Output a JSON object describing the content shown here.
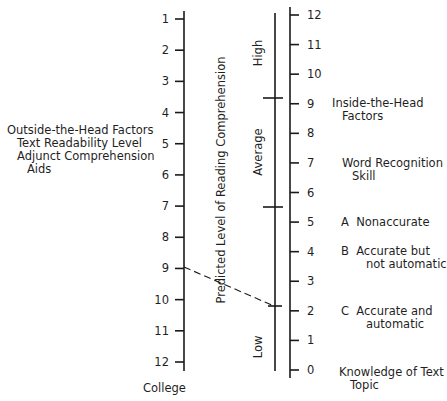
{
  "top_cropped_text": "",
  "left_scale": {
    "title_lines": [
      "Outside-the-Head Factors",
      "Text Readability Level",
      "Adjunct Comprehension",
      "Aids"
    ],
    "ticks": [
      "1",
      "2",
      "3",
      "4",
      "5",
      "6",
      "7",
      "8",
      "9",
      "10",
      "11",
      "12"
    ],
    "bottom_label": "College"
  },
  "middle_scale": {
    "title": "Predicted Level of Reading Comprehension",
    "bands": [
      "High",
      "Average",
      "Low"
    ]
  },
  "right_scale": {
    "ticks": [
      "12",
      "11",
      "10",
      "9",
      "8",
      "7",
      "6",
      "5",
      "4",
      "3",
      "2",
      "1",
      "0"
    ],
    "title_lines": [
      "Inside-the-Head",
      "Factors"
    ],
    "word_recognition_lines": [
      "Word Recognition",
      "Skill"
    ],
    "levels": [
      {
        "letter": "A",
        "lines": [
          "Nonaccurate"
        ]
      },
      {
        "letter": "B",
        "lines": [
          "Accurate but",
          "not automatic"
        ]
      },
      {
        "letter": "C",
        "lines": [
          "Accurate and",
          "automatic"
        ]
      }
    ],
    "knowledge_lines": [
      "Knowledge of Text",
      "Topic"
    ]
  },
  "example_line": {
    "from_left_tick": "9",
    "to": "Low"
  },
  "chart_data": {
    "type": "nomogram",
    "title": "",
    "axes": [
      {
        "name": "Outside-the-Head Factors: Text Readability Level / Adjunct Comprehension Aids",
        "ticks": [
          1,
          2,
          3,
          4,
          5,
          6,
          7,
          8,
          9,
          10,
          11,
          12
        ],
        "bottom_label": "College",
        "direction": "top-to-bottom increasing"
      },
      {
        "name": "Predicted Level of Reading Comprehension",
        "bands": [
          "High",
          "Average",
          "Low"
        ],
        "direction": "top High, bottom Low"
      },
      {
        "name": "Inside-the-Head Factors",
        "ticks": [
          12,
          11,
          10,
          9,
          8,
          7,
          6,
          5,
          4,
          3,
          2,
          1,
          0
        ],
        "direction": "top-to-bottom decreasing",
        "annotations": [
          "Word Recognition Skill",
          "A Nonaccurate (~5)",
          "B Accurate but not automatic (~4)",
          "C Accurate and automatic (~2)",
          "Knowledge of Text Topic (~0)"
        ]
      }
    ],
    "example": {
      "left_value": 9,
      "middle_result": "Low (boundary near right-scale 2)",
      "style": "dashed"
    }
  }
}
